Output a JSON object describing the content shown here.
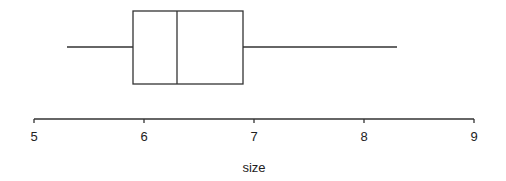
{
  "chart_data": {
    "type": "boxplot",
    "orientation": "horizontal",
    "title": "",
    "xlabel": "size",
    "ylabel": "",
    "xlim": [
      5,
      9
    ],
    "x_ticks": [
      5,
      6,
      7,
      8,
      9
    ],
    "x_tick_labels": [
      "5",
      "6",
      "7",
      "8",
      "9"
    ],
    "grid": false,
    "legend": null,
    "series": [
      {
        "name": "size",
        "whisker_low": 5.3,
        "q1": 5.9,
        "median": 6.3,
        "q3": 6.9,
        "whisker_high": 8.3
      }
    ]
  },
  "layout": {
    "x_origin_px": 34,
    "px_per_unit": 110,
    "axis_y_px": 119,
    "box_top_px": 11,
    "box_bottom_px": 84,
    "whisker_y_px": 47,
    "line_color": "#333333"
  }
}
